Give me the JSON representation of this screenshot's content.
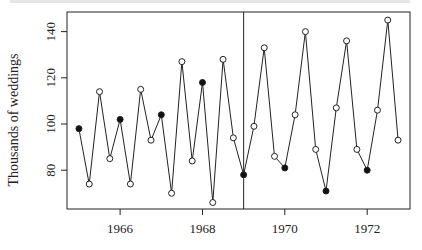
{
  "chart_data": {
    "type": "line",
    "title": "",
    "xlabel": "",
    "ylabel": "Thousands of weddings",
    "xlim": [
      1964.71,
      1973.04
    ],
    "ylim": [
      63.2,
      148.5
    ],
    "grid": false,
    "legend": null,
    "x_ticks": [
      1966,
      1968,
      1970,
      1972
    ],
    "x_tick_labels": [
      "1966",
      "1968",
      "1970",
      "1972"
    ],
    "y_ticks": [
      80,
      100,
      120,
      140
    ],
    "y_tick_labels": [
      "80",
      "100",
      "120",
      "140"
    ],
    "vertical_reference_line": 1969.0,
    "marker_note": "Filled markers = first quarter of each year; open markers = other quarters",
    "series": [
      {
        "name": "Quarterly weddings",
        "x": [
          1965.0,
          1965.25,
          1965.5,
          1965.75,
          1966.0,
          1966.25,
          1966.5,
          1966.75,
          1967.0,
          1967.25,
          1967.5,
          1967.75,
          1968.0,
          1968.25,
          1968.5,
          1968.75,
          1969.0,
          1969.25,
          1969.5,
          1969.75,
          1970.0,
          1970.25,
          1970.5,
          1970.75,
          1971.0,
          1971.25,
          1971.5,
          1971.75,
          1972.0,
          1972.25,
          1972.5,
          1972.75
        ],
        "values": [
          98,
          74,
          114,
          85,
          102,
          74,
          115,
          93,
          104,
          70,
          127,
          84,
          118,
          66,
          128,
          94,
          78,
          99,
          133,
          86,
          81,
          104,
          140,
          89,
          71,
          107,
          136,
          89,
          80,
          106,
          145,
          93
        ],
        "filled": [
          true,
          false,
          false,
          false,
          true,
          false,
          false,
          false,
          true,
          false,
          false,
          false,
          true,
          false,
          false,
          false,
          true,
          false,
          false,
          false,
          true,
          false,
          false,
          false,
          true,
          false,
          false,
          false,
          true,
          false,
          false,
          false
        ]
      }
    ]
  },
  "colors": {
    "line": "#222222",
    "axis": "#222222",
    "marker_fill": "#111111",
    "background": "#ffffff"
  }
}
